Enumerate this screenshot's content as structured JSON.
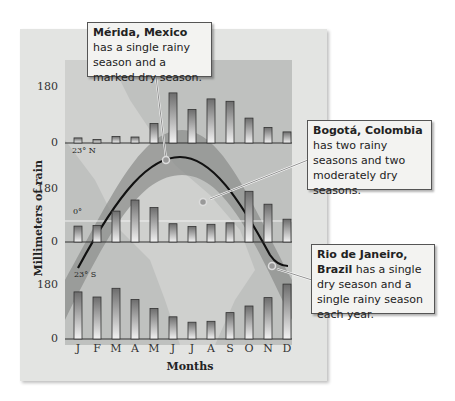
{
  "chart_data": [
    {
      "type": "bar",
      "title": "Mérida, Mexico",
      "categories": [
        "J",
        "F",
        "M",
        "A",
        "M",
        "J",
        "J",
        "A",
        "S",
        "O",
        "N",
        "D"
      ],
      "values": [
        17,
        12,
        22,
        20,
        65,
        167,
        112,
        147,
        139,
        83,
        52,
        37
      ],
      "ylabel": "Millimeters of rain",
      "xlabel": "Months",
      "yticks": [
        0,
        180
      ],
      "latitude_label": "23° N"
    },
    {
      "type": "bar",
      "title": "Bogotá, Colombia",
      "categories": [
        "J",
        "F",
        "M",
        "A",
        "M",
        "J",
        "J",
        "A",
        "S",
        "O",
        "N",
        "D"
      ],
      "values": [
        53,
        55,
        103,
        140,
        115,
        61,
        52,
        59,
        64,
        169,
        126,
        76
      ],
      "ylabel": "Millimeters of rain",
      "xlabel": "Months",
      "yticks": [
        0,
        180
      ],
      "latitude_label": "0°"
    },
    {
      "type": "bar",
      "title": "Rio de Janeiro, Brazil",
      "categories": [
        "J",
        "F",
        "M",
        "A",
        "M",
        "J",
        "J",
        "A",
        "S",
        "O",
        "N",
        "D"
      ],
      "values": [
        157,
        140,
        169,
        132,
        102,
        74,
        56,
        59,
        88,
        110,
        138,
        183
      ],
      "ylabel": "Millimeters of rain",
      "xlabel": "Months",
      "yticks": [
        0,
        180
      ],
      "latitude_label": "23° S"
    }
  ],
  "axis": {
    "ylabel": "Millimeters of rain",
    "xlabel": "Months",
    "ytick_high": "180",
    "ytick_low": "0",
    "months": [
      "J",
      "F",
      "M",
      "A",
      "M",
      "J",
      "J",
      "A",
      "S",
      "O",
      "N",
      "D"
    ]
  },
  "latitudes": {
    "north": "23° N",
    "equator": "0°",
    "south": "23° S"
  },
  "callouts": {
    "merida": {
      "bold": "Mérida, Mexico",
      "text": " has a single rainy season and a marked dry season."
    },
    "bogota": {
      "bold": "Bogotá, Colombia",
      "text": " has two rainy seasons and two moderately dry seasons."
    },
    "rio": {
      "bold": "Rio de Janeiro, Brazil",
      "text": " has a single dry season and a single rainy season each year."
    }
  },
  "colors": {
    "bar_top": "#6d6d6d",
    "bar_bottom": "#f2f2f2",
    "band": "#8a8b8a",
    "curve": "#111111"
  }
}
